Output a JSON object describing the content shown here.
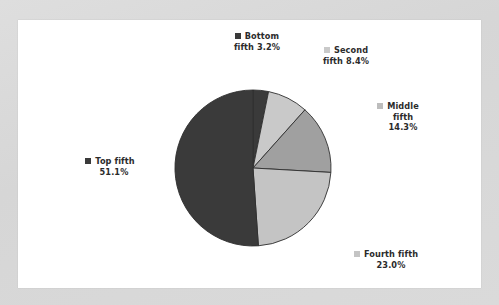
{
  "chart_data": {
    "type": "pie",
    "title": "",
    "subtitle": "",
    "xlabel": "",
    "ylabel": "",
    "legend_position": "external-callouts",
    "grid": false,
    "start_angle_deg": 0,
    "direction": "clockwise",
    "categories": [
      "Bottom fifth",
      "Second fifth",
      "Middle fifth",
      "Fourth fifth",
      "Top fifth"
    ],
    "values": [
      3.2,
      8.4,
      14.3,
      23.0,
      51.1
    ],
    "value_unit": "%",
    "slices": [
      {
        "name": "Bottom fifth",
        "value": 3.2,
        "value_label": "3.2%",
        "color": "#3a3a3a"
      },
      {
        "name": "Second fifth",
        "value": 8.4,
        "value_label": "8.4%",
        "color": "#c9c9c9"
      },
      {
        "name": "Middle fifth",
        "value": 14.3,
        "value_label": "14.3%",
        "color": "#a0a0a0"
      },
      {
        "name": "Fourth fifth",
        "value": 23.0,
        "value_label": "23.0%",
        "color": "#c4c4c4"
      },
      {
        "name": "Top fifth",
        "value": 51.1,
        "value_label": "51.1%",
        "color": "#3a3a3a"
      }
    ]
  },
  "labels": {
    "bottom": {
      "line1": "Bottom",
      "line2": "fifth 3.2%",
      "marker_color": "#3a3a3a"
    },
    "second": {
      "line1": "Second",
      "line2": "fifth 8.4%",
      "marker_color": "#c9c9c9"
    },
    "middle": {
      "line1": "Middle",
      "line2": "fifth",
      "line3": "14.3%",
      "marker_color": "#bdbdbd"
    },
    "top": {
      "line1": "Top fifth",
      "line2": "51.1%",
      "marker_color": "#3a3a3a"
    },
    "fourth": {
      "line1": "Fourth fifth",
      "line2": "23.0%",
      "marker_color": "#c4c4c4"
    }
  },
  "colors": {
    "background": "#d9d9d9",
    "plot_background": "#ffffff",
    "slice_border": "#2f2f2f",
    "text": "#2b2b2b"
  }
}
